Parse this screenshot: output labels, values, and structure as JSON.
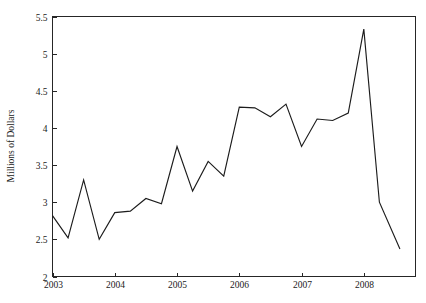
{
  "chart_data": {
    "type": "line",
    "title": "",
    "subtitle": "",
    "xlabel": "",
    "ylabel": "Millions of Dollars",
    "xlim": [
      2003.0,
      2008.83
    ],
    "ylim": [
      2,
      5.5
    ],
    "yticks": [
      2,
      2.5,
      3,
      3.5,
      4,
      4.5,
      5,
      5.5
    ],
    "ytick_labels": [
      "2",
      "2.5",
      "3",
      "3.5",
      "4",
      "4.5",
      "5",
      "5.5"
    ],
    "xticks": [
      2003,
      2004,
      2005,
      2006,
      2007,
      2008
    ],
    "xtick_labels": [
      "2003",
      "2004",
      "2005",
      "2006",
      "2007",
      "2008"
    ],
    "grid": false,
    "legend": false,
    "legend_position": "none",
    "line_color": "#1c1c1c",
    "series": [
      {
        "name": "Millions of Dollars",
        "x": [
          2003.0,
          2003.25,
          2003.5,
          2003.75,
          2004.0,
          2004.25,
          2004.5,
          2004.75,
          2005.0,
          2005.25,
          2005.5,
          2005.75,
          2006.0,
          2006.25,
          2006.5,
          2006.75,
          2007.0,
          2007.25,
          2007.5,
          2007.75,
          2008.0,
          2008.25,
          2008.58
        ],
        "values": [
          2.82,
          2.52,
          3.3,
          2.5,
          2.86,
          2.88,
          3.05,
          2.98,
          3.75,
          3.15,
          3.55,
          3.35,
          4.28,
          4.27,
          4.15,
          4.32,
          3.75,
          4.12,
          4.1,
          4.2,
          5.33,
          3.0,
          2.37
        ]
      }
    ],
    "annotations": []
  }
}
